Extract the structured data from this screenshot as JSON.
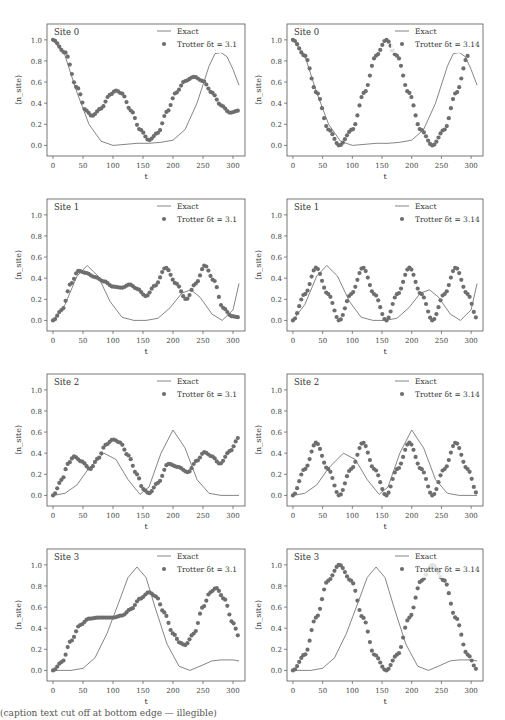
{
  "figure": {
    "caption_visible": "(caption text cut off at bottom edge — illegible)"
  },
  "chart_data": [
    {
      "type": "line+scatter",
      "panel": "site0-dt3.1",
      "title": "Site 0",
      "xlabel": "t",
      "ylabel": "⟨n_site⟩",
      "xlim": [
        -10,
        320
      ],
      "ylim": [
        -0.1,
        1.15
      ],
      "xticks": [
        0,
        50,
        100,
        150,
        200,
        250,
        300
      ],
      "yticks": [
        0.0,
        0.2,
        0.4,
        0.6,
        0.8,
        1.0
      ],
      "legend": [
        "Exact",
        "Trotter δt = 3.1"
      ],
      "series": [
        {
          "name": "Exact",
          "kind": "line",
          "x": [
            0,
            20,
            40,
            60,
            80,
            100,
            120,
            140,
            160,
            180,
            200,
            220,
            240,
            260,
            270,
            280,
            290,
            300,
            310
          ],
          "y": [
            1.0,
            0.85,
            0.5,
            0.2,
            0.04,
            0.0,
            0.01,
            0.02,
            0.02,
            0.03,
            0.05,
            0.15,
            0.4,
            0.75,
            0.87,
            0.88,
            0.84,
            0.72,
            0.57
          ]
        },
        {
          "name": "Trotter δt = 3.1",
          "kind": "scatter",
          "x": [
            0,
            20,
            40,
            55,
            65,
            80,
            95,
            105,
            115,
            130,
            145,
            160,
            175,
            190,
            205,
            220,
            235,
            250,
            265,
            280,
            295,
            310
          ],
          "y": [
            1.0,
            0.88,
            0.55,
            0.33,
            0.28,
            0.35,
            0.48,
            0.52,
            0.49,
            0.33,
            0.15,
            0.05,
            0.12,
            0.32,
            0.5,
            0.61,
            0.65,
            0.61,
            0.5,
            0.38,
            0.31,
            0.33
          ]
        }
      ]
    },
    {
      "type": "line+scatter",
      "panel": "site0-dt3.14",
      "title": "Site 0",
      "xlabel": "t",
      "ylabel": "⟨n_site⟩",
      "xlim": [
        -10,
        320
      ],
      "ylim": [
        -0.1,
        1.15
      ],
      "xticks": [
        0,
        50,
        100,
        150,
        200,
        250,
        300
      ],
      "yticks": [
        0.0,
        0.2,
        0.4,
        0.6,
        0.8,
        1.0
      ],
      "legend": [
        "Exact",
        "Trotter δt = 3.14"
      ],
      "series": [
        {
          "name": "Exact",
          "kind": "line",
          "x": [
            0,
            20,
            40,
            60,
            80,
            100,
            120,
            140,
            160,
            180,
            200,
            220,
            240,
            260,
            270,
            280,
            290,
            300,
            310
          ],
          "y": [
            1.0,
            0.85,
            0.5,
            0.2,
            0.04,
            0.0,
            0.01,
            0.02,
            0.02,
            0.03,
            0.05,
            0.15,
            0.4,
            0.75,
            0.87,
            0.88,
            0.84,
            0.72,
            0.57
          ]
        },
        {
          "name": "Trotter δt = 3.14",
          "kind": "scatter",
          "x": [
            0,
            20,
            40,
            60,
            78,
            100,
            120,
            140,
            157,
            175,
            195,
            215,
            235,
            255,
            275,
            295
          ],
          "y": [
            1.0,
            0.85,
            0.5,
            0.15,
            0.0,
            0.15,
            0.5,
            0.85,
            1.0,
            0.85,
            0.5,
            0.15,
            0.0,
            0.15,
            0.5,
            0.85
          ]
        }
      ]
    },
    {
      "type": "line+scatter",
      "panel": "site1-dt3.1",
      "title": "Site 1",
      "xlabel": "t",
      "ylabel": "⟨n_site⟩",
      "xlim": [
        -10,
        320
      ],
      "ylim": [
        -0.1,
        1.15
      ],
      "xticks": [
        0,
        50,
        100,
        150,
        200,
        250,
        300
      ],
      "yticks": [
        0.0,
        0.2,
        0.4,
        0.6,
        0.8,
        1.0
      ],
      "legend": [
        "Exact",
        "Trotter δt = 3.1"
      ],
      "series": [
        {
          "name": "Exact",
          "kind": "line",
          "x": [
            0,
            20,
            40,
            57,
            75,
            95,
            115,
            135,
            155,
            175,
            195,
            215,
            230,
            245,
            265,
            282,
            300,
            310
          ],
          "y": [
            0.0,
            0.15,
            0.42,
            0.52,
            0.42,
            0.18,
            0.03,
            0.0,
            0.0,
            0.02,
            0.12,
            0.26,
            0.29,
            0.22,
            0.06,
            0.0,
            0.1,
            0.35
          ]
        },
        {
          "name": "Trotter δt = 3.1",
          "kind": "scatter",
          "x": [
            0,
            15,
            30,
            42,
            55,
            70,
            85,
            100,
            115,
            128,
            140,
            155,
            170,
            188,
            205,
            222,
            238,
            253,
            268,
            283,
            298,
            310
          ],
          "y": [
            0.0,
            0.1,
            0.35,
            0.47,
            0.45,
            0.41,
            0.37,
            0.32,
            0.31,
            0.34,
            0.3,
            0.23,
            0.33,
            0.5,
            0.35,
            0.2,
            0.35,
            0.52,
            0.38,
            0.12,
            0.04,
            0.03
          ]
        }
      ]
    },
    {
      "type": "line+scatter",
      "panel": "site1-dt3.14",
      "title": "Site 1",
      "xlabel": "t",
      "ylabel": "⟨n_site⟩",
      "xlim": [
        -10,
        320
      ],
      "ylim": [
        -0.1,
        1.15
      ],
      "xticks": [
        0,
        50,
        100,
        150,
        200,
        250,
        300
      ],
      "yticks": [
        0.0,
        0.2,
        0.4,
        0.6,
        0.8,
        1.0
      ],
      "legend": [
        "Exact",
        "Trotter δt = 3.14"
      ],
      "series": [
        {
          "name": "Exact",
          "kind": "line",
          "x": [
            0,
            20,
            40,
            57,
            75,
            95,
            115,
            135,
            155,
            175,
            195,
            215,
            230,
            245,
            265,
            282,
            300,
            310
          ],
          "y": [
            0.0,
            0.15,
            0.42,
            0.52,
            0.42,
            0.18,
            0.03,
            0.0,
            0.0,
            0.02,
            0.12,
            0.26,
            0.29,
            0.22,
            0.06,
            0.0,
            0.1,
            0.35
          ]
        },
        {
          "name": "Trotter δt = 3.14",
          "kind": "scatter",
          "x": [
            0,
            20,
            39,
            59,
            78,
            98,
            118,
            137,
            157,
            176,
            196,
            216,
            235,
            255,
            274,
            294,
            310
          ],
          "y": [
            0.0,
            0.25,
            0.5,
            0.25,
            0.0,
            0.25,
            0.5,
            0.25,
            0.0,
            0.25,
            0.5,
            0.25,
            0.0,
            0.25,
            0.5,
            0.25,
            0.02
          ]
        }
      ]
    },
    {
      "type": "line+scatter",
      "panel": "site2-dt3.1",
      "title": "Site 2",
      "xlabel": "t",
      "ylabel": "⟨n_site⟩",
      "xlim": [
        -10,
        320
      ],
      "ylim": [
        -0.1,
        1.15
      ],
      "xticks": [
        0,
        50,
        100,
        150,
        200,
        250,
        300
      ],
      "yticks": [
        0.0,
        0.2,
        0.4,
        0.6,
        0.8,
        1.0
      ],
      "legend": [
        "Exact",
        "Trotter δt = 3.1"
      ],
      "series": [
        {
          "name": "Exact",
          "kind": "line",
          "x": [
            0,
            20,
            40,
            60,
            85,
            105,
            125,
            145,
            160,
            180,
            200,
            220,
            240,
            260,
            280,
            310
          ],
          "y": [
            0.0,
            0.02,
            0.1,
            0.26,
            0.4,
            0.34,
            0.15,
            0.01,
            0.08,
            0.4,
            0.62,
            0.45,
            0.15,
            0.02,
            0.0,
            0.0
          ]
        },
        {
          "name": "Trotter δt = 3.1",
          "kind": "scatter",
          "x": [
            0,
            15,
            25,
            35,
            48,
            62,
            75,
            88,
            100,
            112,
            125,
            140,
            150,
            160,
            175,
            192,
            208,
            225,
            240,
            252,
            265,
            278,
            295,
            310
          ],
          "y": [
            0.0,
            0.15,
            0.3,
            0.37,
            0.32,
            0.25,
            0.35,
            0.48,
            0.53,
            0.5,
            0.38,
            0.2,
            0.06,
            0.02,
            0.12,
            0.3,
            0.27,
            0.22,
            0.33,
            0.41,
            0.37,
            0.3,
            0.42,
            0.55
          ]
        }
      ]
    },
    {
      "type": "line+scatter",
      "panel": "site2-dt3.14",
      "title": "Site 2",
      "xlabel": "t",
      "ylabel": "⟨n_site⟩",
      "xlim": [
        -10,
        320
      ],
      "ylim": [
        -0.1,
        1.15
      ],
      "xticks": [
        0,
        50,
        100,
        150,
        200,
        250,
        300
      ],
      "yticks": [
        0.0,
        0.2,
        0.4,
        0.6,
        0.8,
        1.0
      ],
      "legend": [
        "Exact",
        "Trotter δt = 3.14"
      ],
      "series": [
        {
          "name": "Exact",
          "kind": "line",
          "x": [
            0,
            20,
            40,
            60,
            85,
            105,
            125,
            145,
            160,
            180,
            200,
            220,
            240,
            260,
            280,
            310
          ],
          "y": [
            0.0,
            0.02,
            0.1,
            0.26,
            0.4,
            0.34,
            0.15,
            0.01,
            0.08,
            0.4,
            0.62,
            0.45,
            0.15,
            0.02,
            0.0,
            0.0
          ]
        },
        {
          "name": "Trotter δt = 3.14",
          "kind": "scatter",
          "x": [
            0,
            20,
            39,
            59,
            78,
            98,
            118,
            137,
            157,
            176,
            196,
            216,
            235,
            255,
            274,
            294,
            310
          ],
          "y": [
            0.0,
            0.25,
            0.5,
            0.25,
            0.0,
            0.25,
            0.5,
            0.25,
            0.0,
            0.25,
            0.5,
            0.25,
            0.0,
            0.25,
            0.5,
            0.25,
            0.02
          ]
        }
      ]
    },
    {
      "type": "line+scatter",
      "panel": "site3-dt3.1",
      "title": "Site 3",
      "xlabel": "t",
      "ylabel": "⟨n_site⟩",
      "xlim": [
        -10,
        320
      ],
      "ylim": [
        -0.1,
        1.15
      ],
      "xticks": [
        0,
        50,
        100,
        150,
        200,
        250,
        300
      ],
      "yticks": [
        0.0,
        0.2,
        0.4,
        0.6,
        0.8,
        1.0
      ],
      "legend": [
        "Exact",
        "Trotter δt = 3.1"
      ],
      "series": [
        {
          "name": "Exact",
          "kind": "line",
          "x": [
            0,
            30,
            50,
            70,
            90,
            110,
            125,
            140,
            155,
            170,
            190,
            210,
            228,
            245,
            265,
            280,
            300,
            310
          ],
          "y": [
            0.0,
            0.0,
            0.02,
            0.12,
            0.35,
            0.65,
            0.88,
            0.98,
            0.88,
            0.6,
            0.25,
            0.04,
            0.0,
            0.04,
            0.09,
            0.1,
            0.1,
            0.09
          ]
        },
        {
          "name": "Trotter δt = 3.1",
          "kind": "scatter",
          "x": [
            0,
            15,
            30,
            45,
            60,
            75,
            90,
            100,
            115,
            130,
            145,
            160,
            172,
            185,
            200,
            212,
            220,
            235,
            250,
            262,
            272,
            285,
            300,
            310
          ],
          "y": [
            0.0,
            0.08,
            0.28,
            0.43,
            0.49,
            0.5,
            0.5,
            0.5,
            0.52,
            0.58,
            0.68,
            0.74,
            0.7,
            0.55,
            0.35,
            0.26,
            0.24,
            0.35,
            0.6,
            0.74,
            0.78,
            0.68,
            0.45,
            0.32
          ]
        }
      ]
    },
    {
      "type": "line+scatter",
      "panel": "site3-dt3.14",
      "title": "Site 3",
      "xlabel": "t",
      "ylabel": "⟨n_site⟩",
      "xlim": [
        -10,
        320
      ],
      "ylim": [
        -0.1,
        1.15
      ],
      "xticks": [
        0,
        50,
        100,
        150,
        200,
        250,
        300
      ],
      "yticks": [
        0.0,
        0.2,
        0.4,
        0.6,
        0.8,
        1.0
      ],
      "legend": [
        "Exact",
        "Trotter δt = 3.14"
      ],
      "series": [
        {
          "name": "Exact",
          "kind": "line",
          "x": [
            0,
            30,
            50,
            70,
            90,
            110,
            125,
            140,
            155,
            170,
            190,
            210,
            228,
            245,
            265,
            280,
            300,
            310
          ],
          "y": [
            0.0,
            0.0,
            0.02,
            0.12,
            0.35,
            0.65,
            0.88,
            0.98,
            0.88,
            0.6,
            0.25,
            0.04,
            0.0,
            0.04,
            0.09,
            0.1,
            0.1,
            0.09
          ]
        },
        {
          "name": "Trotter δt = 3.14",
          "kind": "scatter",
          "x": [
            0,
            20,
            39,
            59,
            78,
            98,
            118,
            137,
            157,
            176,
            196,
            216,
            235,
            255,
            274,
            294,
            310
          ],
          "y": [
            0.0,
            0.15,
            0.5,
            0.85,
            1.0,
            0.85,
            0.5,
            0.15,
            0.0,
            0.15,
            0.5,
            0.85,
            1.0,
            0.85,
            0.5,
            0.15,
            0.01
          ]
        }
      ]
    }
  ]
}
